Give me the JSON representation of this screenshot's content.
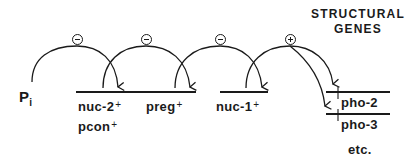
{
  "header": {
    "line1": "STRUCTURAL",
    "line2": "GENES"
  },
  "nodes": {
    "pi": {
      "base": "P",
      "subscript": "i"
    },
    "nuc2": {
      "name": "nuc-2",
      "sup": "+"
    },
    "pcon": {
      "name": "pcon",
      "sup": "+"
    },
    "preg": {
      "name": "preg",
      "sup": "+"
    },
    "nuc1": {
      "name": "nuc-1",
      "sup": "+"
    },
    "pho2": {
      "name": "pho-2"
    },
    "pho3": {
      "name": "pho-3"
    },
    "etc": {
      "name": "etc."
    }
  },
  "regulation": [
    {
      "from": "Pi",
      "to": "nuc-2+ / pcon+",
      "sign": "negative",
      "symbol": "⊖"
    },
    {
      "from": "nuc-2+ / pcon+",
      "to": "preg+",
      "sign": "negative",
      "symbol": "⊖"
    },
    {
      "from": "preg+",
      "to": "nuc-1+",
      "sign": "negative",
      "symbol": "⊖"
    },
    {
      "from": "nuc-1+",
      "to": "structural genes (pho-2, pho-3, etc.)",
      "sign": "positive",
      "symbol": "⊕"
    }
  ],
  "colors": {
    "ink": "#1a1a1a",
    "background": "#ffffff"
  }
}
